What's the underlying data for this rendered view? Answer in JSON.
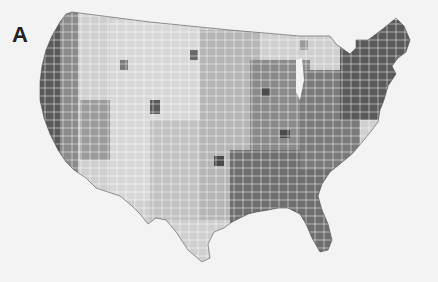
{
  "panel_label": "A",
  "map": {
    "subject": "United States counties choropleth",
    "palette": [
      "#d6d6d6",
      "#b8b8b8",
      "#8e8e8e",
      "#6a6a6a",
      "#4a4a4a"
    ]
  }
}
